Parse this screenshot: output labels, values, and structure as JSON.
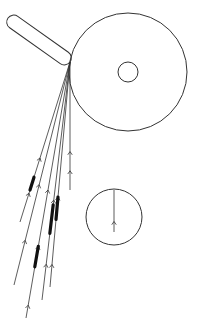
{
  "diagram": {
    "width": 197,
    "height": 319,
    "stroke_color": "#333333",
    "fill_color": "#111111",
    "background": "#ffffff",
    "source_tube": {
      "x1": 8,
      "y1": 18,
      "x2": 70,
      "y2": 62,
      "width": 14
    },
    "large_circle": {
      "cx": 128,
      "cy": 72,
      "r": 59
    },
    "inner_circle": {
      "cx": 128,
      "cy": 72,
      "r": 10
    },
    "small_circle": {
      "cx": 114,
      "cy": 217,
      "r": 28
    },
    "small_circle_track": {
      "x1": 114,
      "y1": 190,
      "x2": 114,
      "y2": 232,
      "arrow_at": 0.75
    },
    "origin": {
      "x": 70,
      "y": 62
    },
    "tracks": [
      {
        "end": [
          20,
          222
        ],
        "arrows": [
          0.6,
          0.82
        ],
        "thick": [
          0.72,
          0.8
        ]
      },
      {
        "end": [
          14,
          285
        ],
        "arrows": [
          0.55,
          0.8
        ],
        "thick": null
      },
      {
        "end": [
          26,
          318
        ],
        "arrows": [
          0.5,
          0.72,
          0.95
        ],
        "thick": [
          0.72,
          0.8
        ]
      },
      {
        "end": [
          42,
          300
        ],
        "arrows": [
          0.58,
          0.85
        ],
        "thick": [
          0.6,
          0.72
        ]
      },
      {
        "end": [
          50,
          287
        ],
        "arrows": [
          0.6,
          0.9
        ],
        "thick": [
          0.6,
          0.7
        ]
      },
      {
        "end": [
          70,
          190
        ],
        "arrows": [
          0.7,
          0.85
        ],
        "thick": null
      }
    ]
  }
}
